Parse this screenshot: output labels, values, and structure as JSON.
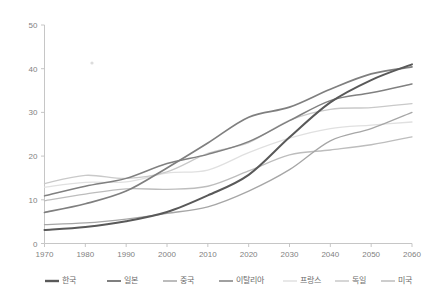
{
  "chart_data": {
    "type": "line",
    "title": "",
    "subtitle": "",
    "xlabel": "",
    "ylabel": "",
    "xlim": [
      1970,
      2060
    ],
    "ylim": [
      0,
      50
    ],
    "xticks": [
      "1970",
      "1980",
      "1990",
      "2000",
      "2010",
      "2020",
      "2030",
      "2040",
      "2050",
      "2060"
    ],
    "yticks": [
      "0",
      "10",
      "20",
      "30",
      "40",
      "50"
    ],
    "grid": false,
    "legend_position": "bottom",
    "x": [
      1970,
      1980,
      1990,
      2000,
      2010,
      2020,
      2030,
      2040,
      2050,
      2060
    ],
    "series": [
      {
        "name": "한국",
        "color": "#595959",
        "width": 2.0,
        "values": [
          3.1,
          3.8,
          5.1,
          7.2,
          11.0,
          15.7,
          24.3,
          32.3,
          37.4,
          41.0
        ]
      },
      {
        "name": "일본",
        "color": "#7f7f7f",
        "width": 1.7,
        "values": [
          7.1,
          9.1,
          12.0,
          17.3,
          23.0,
          28.9,
          31.2,
          35.3,
          38.8,
          40.4
        ]
      },
      {
        "name": "중국",
        "color": "#a6a6a6",
        "width": 1.3,
        "values": [
          4.3,
          4.7,
          5.6,
          6.9,
          8.4,
          12.0,
          16.9,
          23.5,
          26.3,
          30.0
        ]
      },
      {
        "name": "이탈리아",
        "color": "#808080",
        "width": 1.5,
        "values": [
          10.9,
          13.1,
          14.9,
          18.3,
          20.4,
          23.3,
          28.1,
          32.7,
          34.5,
          36.5
        ]
      },
      {
        "name": "프랑스",
        "color": "#e0e0e0",
        "width": 1.3,
        "values": [
          12.9,
          14.0,
          14.1,
          16.1,
          16.8,
          20.8,
          24.1,
          26.3,
          27.1,
          27.8
        ]
      },
      {
        "name": "독일",
        "color": "#c9c9c9",
        "width": 1.3,
        "values": [
          13.7,
          15.6,
          14.9,
          16.4,
          20.6,
          23.1,
          28.2,
          30.7,
          31.1,
          32.0
        ]
      },
      {
        "name": "미국",
        "color": "#bdbdbd",
        "width": 1.3,
        "values": [
          9.8,
          11.3,
          12.5,
          12.4,
          13.1,
          16.6,
          20.3,
          21.4,
          22.6,
          24.4
        ]
      }
    ]
  },
  "legend": {
    "items": [
      {
        "label": "한국",
        "color": "#595959"
      },
      {
        "label": "일본",
        "color": "#7f7f7f"
      },
      {
        "label": "중국",
        "color": "#a6a6a6"
      },
      {
        "label": "이탈리아",
        "color": "#808080"
      },
      {
        "label": "프랑스",
        "color": "#e0e0e0"
      },
      {
        "label": "독일",
        "color": "#c9c9c9"
      },
      {
        "label": "미국",
        "color": "#bdbdbd"
      }
    ]
  },
  "axes": {
    "y_labels": [
      "50",
      "40",
      "30",
      "20",
      "10",
      "0"
    ],
    "x_labels": [
      "1970",
      "1980",
      "1990",
      "2000",
      "2010",
      "2020",
      "2030",
      "2040",
      "2050",
      "2060"
    ]
  }
}
